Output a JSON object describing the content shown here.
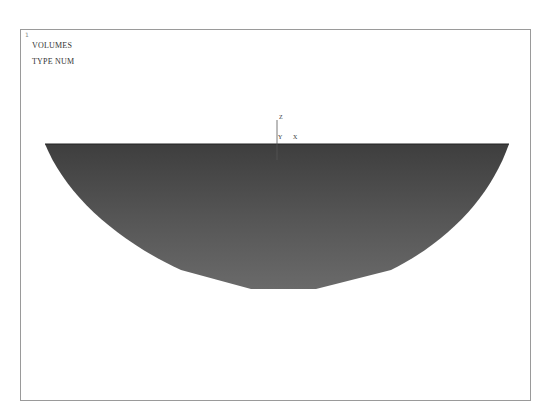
{
  "viewport": {
    "window_number": "1",
    "title_lines": [
      "VOLUMES",
      "TYPE NUM"
    ]
  },
  "triad": {
    "labels": {
      "y": "Y",
      "x": "X",
      "z": "Z"
    }
  },
  "model": {
    "type": "half-sphere volume",
    "fill_color": "#5a5a5a"
  }
}
